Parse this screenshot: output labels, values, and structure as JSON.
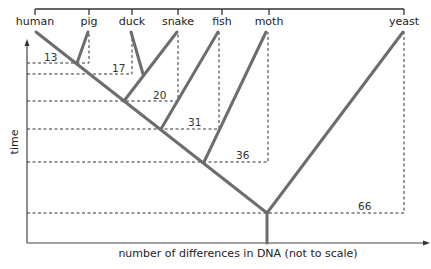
{
  "diagram": {
    "type": "phylogenetic-tree",
    "taxa": [
      {
        "name": "human",
        "x": 35
      },
      {
        "name": "pig",
        "x": 89
      },
      {
        "name": "duck",
        "x": 132
      },
      {
        "name": "snake",
        "x": 178
      },
      {
        "name": "fish",
        "x": 222
      },
      {
        "name": "moth",
        "x": 269
      },
      {
        "name": "yeast",
        "x": 404
      }
    ],
    "differences": [
      {
        "value": "13",
        "taxon": "pig"
      },
      {
        "value": "17",
        "taxon": "duck"
      },
      {
        "value": "20",
        "taxon": "snake"
      },
      {
        "value": "31",
        "taxon": "fish"
      },
      {
        "value": "36",
        "taxon": "moth"
      },
      {
        "value": "66",
        "taxon": "yeast"
      }
    ],
    "axes": {
      "x_label": "number of differences in DNA (not to scale)",
      "y_label": "time"
    },
    "colors": {
      "branch": "#6d6d6d",
      "dashed": "#333333",
      "axis": "#444444"
    }
  }
}
